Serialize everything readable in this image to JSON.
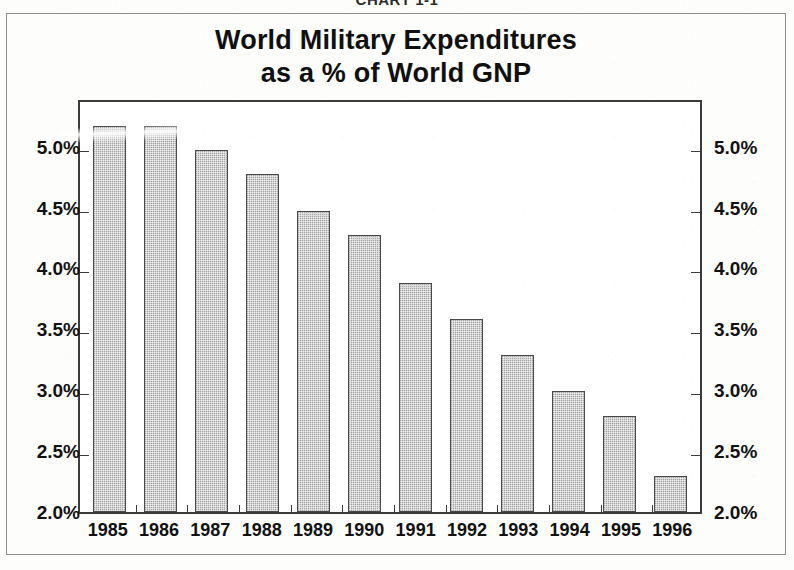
{
  "header": {
    "chart_number": "CHART 1-1"
  },
  "chart_data": {
    "type": "bar",
    "title": "World Military Expenditures as a % of World GNP",
    "title_lines": [
      "World Military Expenditures",
      "as a % of World GNP"
    ],
    "xlabel": "",
    "ylabel": "",
    "ylim": [
      2.0,
      5.4
    ],
    "grid": false,
    "legend": null,
    "axis_tick_labels": [
      "2.0%",
      "2.5%",
      "3.0%",
      "3.5%",
      "4.0%",
      "4.5%",
      "5.0%"
    ],
    "axis_tick_values": [
      2.0,
      2.5,
      3.0,
      3.5,
      4.0,
      4.5,
      5.0
    ],
    "dual_axis": true,
    "categories": [
      "1985",
      "1986",
      "1987",
      "1988",
      "1989",
      "1990",
      "1991",
      "1992",
      "1993",
      "1994",
      "1995",
      "1996"
    ],
    "values": [
      5.2,
      5.2,
      5.0,
      4.8,
      4.5,
      4.3,
      3.9,
      3.6,
      3.3,
      3.0,
      2.8,
      2.3
    ],
    "bars": [
      {
        "category": "1985",
        "value": 5.2,
        "label": "5.2%"
      },
      {
        "category": "1986",
        "value": 5.2,
        "label": "5.2%"
      },
      {
        "category": "1987",
        "value": 5.0,
        "label": "5.0%"
      },
      {
        "category": "1988",
        "value": 4.8,
        "label": "4.8%"
      },
      {
        "category": "1989",
        "value": 4.5,
        "label": "4.5%"
      },
      {
        "category": "1990",
        "value": 4.3,
        "label": "4.3%"
      },
      {
        "category": "1991",
        "value": 3.9,
        "label": "3.9%"
      },
      {
        "category": "1992",
        "value": 3.6,
        "label": "3.6%"
      },
      {
        "category": "1993",
        "value": 3.3,
        "label": "3.3%"
      },
      {
        "category": "1994",
        "value": 3.0,
        "label": "3.0%"
      },
      {
        "category": "1995",
        "value": 2.8,
        "label": "2.8%"
      },
      {
        "category": "1996",
        "value": 2.3,
        "label": "2.3%"
      }
    ]
  },
  "colors": {
    "bar_fill": "#a2a2a2",
    "bar_stroke": "#4a4a4a",
    "plot_border": "#3b3b3b",
    "frame_border": "#8d8d8d",
    "text": "#111111",
    "page_background": "#fdfdfc"
  }
}
